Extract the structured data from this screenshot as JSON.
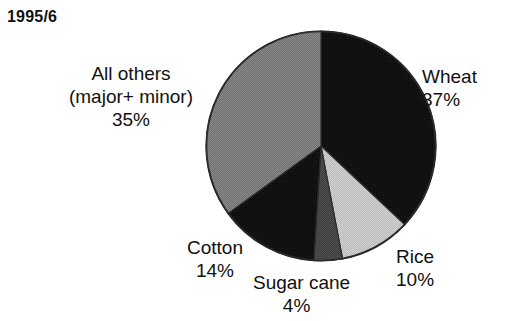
{
  "chart_data": {
    "type": "pie",
    "title": "1995/6",
    "xlabel": "",
    "ylabel": "",
    "legend_position": "none",
    "grid": false,
    "start_angle_deg": 0,
    "direction": "clockwise",
    "categories": [
      "Wheat",
      "Rice",
      "Sugar cane",
      "Cotton",
      "All others (major+ minor)"
    ],
    "values": [
      37,
      10,
      4,
      14,
      35
    ],
    "value_unit": "%",
    "slice_colors": [
      "#0d0d0d",
      "#c9c9c9",
      "#4d4d4d",
      "#111111",
      "#838383"
    ],
    "slices": [
      {
        "name": "Wheat",
        "value": 37,
        "value_label": "37%",
        "color": "#0d0d0d",
        "label_lines": [
          "Wheat",
          "37%"
        ]
      },
      {
        "name": "Rice",
        "value": 10,
        "value_label": "10%",
        "color": "#c9c9c9",
        "label_lines": [
          "Rice",
          "10%"
        ]
      },
      {
        "name": "Sugar cane",
        "value": 4,
        "value_label": "4%",
        "color": "#4d4d4d",
        "label_lines": [
          "Sugar cane",
          "4%"
        ]
      },
      {
        "name": "Cotton",
        "value": 14,
        "value_label": "14%",
        "color": "#111111",
        "label_lines": [
          "Cotton",
          "14%"
        ]
      },
      {
        "name": "All others",
        "value": 35,
        "value_label": "35%",
        "color": "#838383",
        "label_lines": [
          "All others",
          "(major+ minor)",
          "35%"
        ]
      }
    ]
  },
  "labels": {
    "all_others": {
      "name": "All others",
      "sub": "(major+ minor)",
      "value": "35%"
    },
    "wheat": {
      "name": "Wheat",
      "value": "37%"
    },
    "rice": {
      "name": "Rice",
      "value": "10%"
    },
    "sugar_cane": {
      "name": "Sugar cane",
      "value": "4%"
    },
    "cotton": {
      "name": "Cotton",
      "value": "14%"
    }
  },
  "style": {
    "background": "#ffffff",
    "text_color": "#111111",
    "outline_color": "#2b2b2b"
  }
}
